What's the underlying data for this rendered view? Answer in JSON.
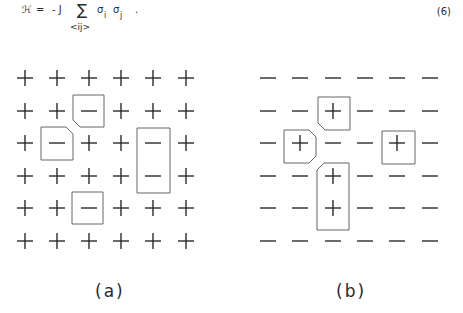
{
  "equation": {
    "lhs": "ℋ",
    "equals": "=",
    "coeff": "- J",
    "sum": "∑",
    "sum_sub": "<ij>",
    "sigma1": "σ",
    "sub1": "i",
    "sigma2": "σ",
    "sub2": "j",
    "period": ".",
    "number": "(6)"
  },
  "figures": [
    {
      "caption": "(a)",
      "background_spin": "+",
      "grid": [
        [
          "+",
          "+",
          "+",
          "+",
          "+",
          "+"
        ],
        [
          "+",
          "+",
          "−",
          "+",
          "+",
          "+"
        ],
        [
          "+",
          "−",
          "+",
          "+",
          "−",
          "+"
        ],
        [
          "+",
          "+",
          "+",
          "+",
          "−",
          "+"
        ],
        [
          "+",
          "+",
          "−",
          "+",
          "+",
          "+"
        ],
        [
          "+",
          "+",
          "+",
          "+",
          "+",
          "+"
        ]
      ]
    },
    {
      "caption": "(b)",
      "background_spin": "−",
      "grid": [
        [
          "−",
          "−",
          "−",
          "−",
          "−",
          "−"
        ],
        [
          "−",
          "−",
          "+",
          "−",
          "−",
          "−"
        ],
        [
          "−",
          "+",
          "−",
          "−",
          "+",
          "−"
        ],
        [
          "−",
          "−",
          "+",
          "−",
          "−",
          "−"
        ],
        [
          "−",
          "−",
          "+",
          "−",
          "−",
          "−"
        ],
        [
          "−",
          "−",
          "−",
          "−",
          "−",
          "−"
        ]
      ]
    }
  ]
}
